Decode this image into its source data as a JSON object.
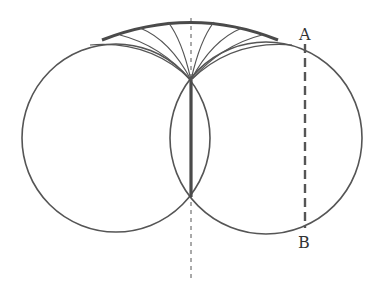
{
  "diagram": {
    "labels": {
      "a": "A",
      "b": "B"
    },
    "colors": {
      "stroke": "#555555",
      "thick": "#4a4a4a"
    },
    "circles": [
      {
        "name": "left",
        "cx": 116,
        "cy": 138,
        "r": 94
      },
      {
        "name": "right",
        "cx": 266,
        "cy": 138,
        "r": 96
      }
    ],
    "intersections": {
      "top": [
        191,
        80
      ],
      "bottom": [
        191,
        197
      ]
    }
  }
}
